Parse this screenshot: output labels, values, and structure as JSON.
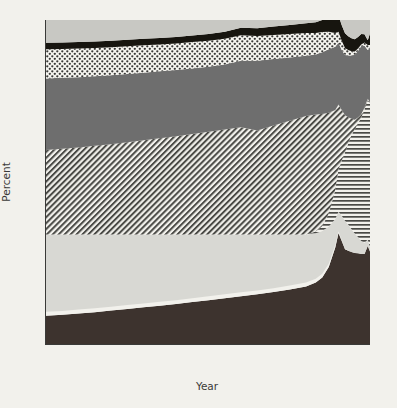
{
  "figure": {
    "background_color": "#f2f1ec",
    "axis_color": "#3a3a38"
  },
  "axes": {
    "y": {
      "title": "Percent",
      "ticks": [
        100,
        80,
        60,
        40,
        20
      ],
      "tick_labels": [
        "100",
        "80",
        "60",
        "40",
        "20"
      ],
      "minor_ticks": [
        90,
        70,
        50,
        30,
        10
      ],
      "limits": [
        0,
        100
      ]
    },
    "x": {
      "title": "Year",
      "ticks": [
        1000,
        1200,
        1400,
        1600,
        1800,
        2000
      ],
      "tick_labels": [
        "1000",
        "1200",
        "1400",
        "1600",
        "1800",
        "2000"
      ],
      "minor_ticks": [
        1100,
        1300,
        1500,
        1700,
        1900
      ],
      "limits": [
        1000,
        2000
      ]
    }
  },
  "chart_data": {
    "type": "area",
    "stacked": true,
    "title": "",
    "xlabel": "Year",
    "ylabel": "Percent",
    "xlim": [
      1000,
      2000
    ],
    "ylim": [
      0,
      100
    ],
    "grid": false,
    "legend_position": "none",
    "x": [
      1000,
      1050,
      1100,
      1150,
      1200,
      1250,
      1300,
      1350,
      1400,
      1450,
      1500,
      1550,
      1600,
      1650,
      1700,
      1750,
      1800,
      1830,
      1850,
      1870,
      1890,
      1900,
      1910,
      1920,
      1930,
      1940,
      1950,
      1960,
      1970,
      1980,
      1990,
      2000
    ],
    "series": [
      {
        "name": "band-1-bottom",
        "pattern": "solid-dark",
        "color": "#3d332e",
        "values": [
          9.0,
          9.3,
          9.7,
          10.1,
          10.6,
          11.1,
          11.6,
          12.1,
          12.6,
          13.2,
          13.8,
          14.4,
          15.0,
          15.6,
          16.3,
          17.1,
          18.0,
          19.2,
          20.8,
          24.0,
          30.0,
          34.5,
          32.0,
          29.5,
          29.0,
          28.6,
          28.3,
          28.2,
          28.0,
          28.0,
          30.5,
          28.0
        ]
      },
      {
        "name": "band-2-white-gap",
        "pattern": "white",
        "color": "#f2f1ec",
        "values": [
          1.2,
          1.2,
          1.2,
          1.2,
          1.2,
          1.2,
          1.2,
          1.2,
          1.2,
          1.2,
          1.2,
          1.2,
          1.2,
          1.2,
          1.2,
          1.2,
          1.2,
          1.2,
          1.1,
          1.0,
          0.8,
          0.5,
          0.3,
          0.2,
          0.1,
          0.0,
          0.0,
          0.0,
          0.0,
          0.0,
          0.0,
          0.0
        ]
      },
      {
        "name": "band-3-light-gray",
        "pattern": "solid-light-gray",
        "color": "#d8d8d3",
        "values": [
          23.8,
          23.5,
          23.1,
          22.7,
          22.2,
          21.7,
          21.2,
          20.7,
          20.2,
          19.6,
          19.0,
          18.4,
          17.8,
          17.2,
          16.5,
          15.7,
          14.8,
          14.0,
          13.2,
          11.5,
          8.0,
          6.0,
          7.5,
          8.5,
          8.0,
          7.0,
          6.0,
          5.0,
          4.0,
          3.5,
          2.0,
          1.0
        ]
      },
      {
        "name": "band-4-horizontal-lines",
        "pattern": "horizontal-lines",
        "color": "#4a4a46",
        "values": [
          0.0,
          0.0,
          0.0,
          0.0,
          0.0,
          0.0,
          0.0,
          0.0,
          0.0,
          0.0,
          0.0,
          0.0,
          0.0,
          0.0,
          0.0,
          0.0,
          0.0,
          0.5,
          1.5,
          4.0,
          9.0,
          13.0,
          17.0,
          21.0,
          25.0,
          29.0,
          32.0,
          35.0,
          38.0,
          41.0,
          43.0,
          45.0
        ]
      },
      {
        "name": "band-5-diagonal-hatch",
        "pattern": "diagonal-hatch",
        "color": "#4a4a46",
        "values": [
          26.0,
          26.4,
          26.8,
          27.3,
          27.8,
          28.4,
          29.0,
          29.6,
          30.2,
          30.9,
          31.6,
          32.3,
          33.0,
          32.0,
          33.5,
          35.0,
          36.5,
          36.0,
          34.5,
          31.0,
          24.5,
          20.0,
          15.5,
          11.5,
          8.0,
          5.0,
          3.0,
          1.8,
          1.0,
          0.6,
          0.3,
          0.2
        ]
      },
      {
        "name": "band-6-medium-gray",
        "pattern": "solid-medium-gray",
        "color": "#6e6e6e",
        "values": [
          22.0,
          21.8,
          21.6,
          21.4,
          21.2,
          21.0,
          20.8,
          20.6,
          20.4,
          20.2,
          20.0,
          20.0,
          20.5,
          21.5,
          20.5,
          19.5,
          18.5,
          18.5,
          19.0,
          19.5,
          19.5,
          19.0,
          18.5,
          18.5,
          19.0,
          19.5,
          20.0,
          20.5,
          21.0,
          19.0,
          15.0,
          17.5
        ]
      },
      {
        "name": "band-7-dotted",
        "pattern": "dotted",
        "color": "#3a3a38",
        "values": [
          9.0,
          8.9,
          8.8,
          8.7,
          8.6,
          8.5,
          8.4,
          8.3,
          8.2,
          8.1,
          8.0,
          7.9,
          7.8,
          7.6,
          7.4,
          7.2,
          7.0,
          6.6,
          6.2,
          5.4,
          4.2,
          3.4,
          2.8,
          2.2,
          1.7,
          1.3,
          1.0,
          0.7,
          0.5,
          1.0,
          1.5,
          0.6
        ]
      },
      {
        "name": "band-8-black",
        "pattern": "solid-black",
        "color": "#17150f",
        "values": [
          2.0,
          2.0,
          2.0,
          2.0,
          2.0,
          2.0,
          2.0,
          2.0,
          2.0,
          2.0,
          2.1,
          2.2,
          2.3,
          2.4,
          2.6,
          2.8,
          3.0,
          3.3,
          3.7,
          4.2,
          4.8,
          5.0,
          4.8,
          4.5,
          4.2,
          4.0,
          3.8,
          3.6,
          3.2,
          2.5,
          1.5,
          4.5
        ]
      },
      {
        "name": "band-9-top-light-gray",
        "pattern": "solid-light-gray-top",
        "color": "#c8c8c3",
        "values": [
          7.0,
          6.9,
          6.8,
          6.6,
          6.4,
          6.1,
          5.8,
          5.5,
          5.2,
          4.8,
          4.3,
          3.6,
          2.4,
          2.5,
          3.2,
          3.5,
          3.5,
          3.9,
          4.5,
          5.4,
          6.2,
          6.6,
          6.6,
          6.6,
          6.0,
          5.6,
          5.9,
          6.2,
          6.3,
          8.4,
          11.2,
          6.2
        ]
      }
    ]
  }
}
